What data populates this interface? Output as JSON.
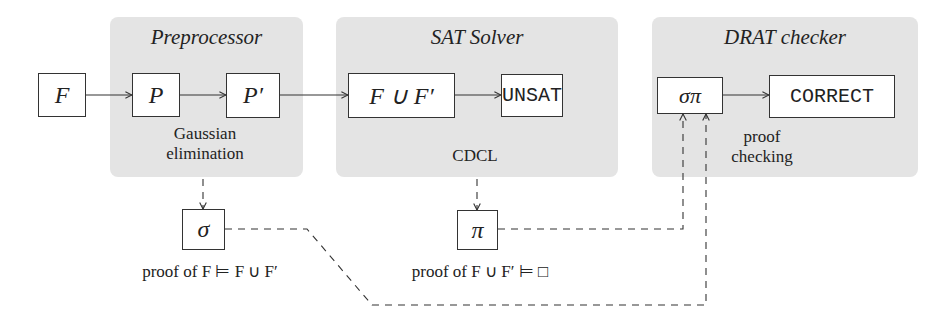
{
  "panels": [
    {
      "id": "preprocessor",
      "title": "Preprocessor",
      "caption": [
        "Gaussian",
        "elimination"
      ]
    },
    {
      "id": "sat_solver",
      "title": "SAT Solver",
      "caption": [
        "CDCL"
      ]
    },
    {
      "id": "drat_checker",
      "title": "DRAT checker",
      "caption": [
        "proof",
        "checking"
      ]
    }
  ],
  "nodes": {
    "F": "F",
    "P": "P",
    "P_prime": "P′",
    "F_union": "F ∪ F′",
    "unsat": "UNSAT",
    "sigma_pi": "σπ",
    "correct": "CORRECT",
    "sigma": "σ",
    "pi": "π"
  },
  "labels": {
    "sigma_caption": "proof of F ⊨ F ∪ F′",
    "pi_caption": "proof of F ∪ F′ ⊨ □"
  },
  "colors": {
    "panel": "#e4e4e4",
    "stroke": "#333333"
  }
}
